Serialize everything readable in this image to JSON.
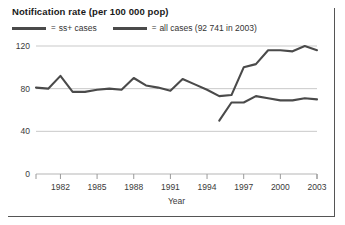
{
  "chart_data": {
    "type": "line",
    "title": "Notification rate (per 100 000 pop)",
    "xlabel": "Year",
    "ylabel": "",
    "xlim": [
      1980,
      2003
    ],
    "ylim": [
      0,
      125
    ],
    "yticks": [
      0,
      40,
      80,
      120
    ],
    "xticks": [
      1982,
      1985,
      1988,
      1991,
      1994,
      1997,
      2000,
      2003
    ],
    "grid": true,
    "legend_position": "top-left",
    "legend": [
      {
        "prefix": "=",
        "label": "ss+ cases"
      },
      {
        "prefix": "=",
        "label": "all cases (92 741 in 2003)"
      }
    ],
    "series": [
      {
        "name": "all cases (92 741 in 2003)",
        "x": [
          1980,
          1981,
          1982,
          1983,
          1984,
          1985,
          1986,
          1987,
          1988,
          1989,
          1990,
          1991,
          1992,
          1993,
          1994,
          1995,
          1996,
          1997,
          1998,
          1999,
          2000,
          2001,
          2002,
          2003
        ],
        "values": [
          81,
          80,
          92,
          77,
          77,
          79,
          80,
          79,
          90,
          83,
          81,
          78,
          89,
          84,
          79,
          73,
          74,
          100,
          103,
          116,
          116,
          115,
          120,
          116
        ]
      },
      {
        "name": "ss+ cases",
        "x": [
          1995,
          1996,
          1997,
          1998,
          1999,
          2000,
          2001,
          2002,
          2003
        ],
        "values": [
          50,
          67,
          67,
          73,
          71,
          69,
          69,
          71,
          70
        ]
      }
    ],
    "colors": {
      "series_line": "#4a4a4a",
      "gridline": "#c9c9c9",
      "text": "#333333",
      "title": "#1a1a1a"
    }
  }
}
